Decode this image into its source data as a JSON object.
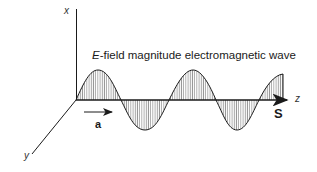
{
  "diagram": {
    "title_italic": "E",
    "title_rest": "-field magnitude electromagnetic wave",
    "axes": {
      "x_label": "x",
      "y_label": "y",
      "z_label": "z"
    },
    "vectors": {
      "unit_vector_label": "a",
      "poynting_label": "S"
    },
    "colors": {
      "line": "#1a1a1a",
      "hatch": "#555555",
      "background": "#ffffff"
    }
  }
}
